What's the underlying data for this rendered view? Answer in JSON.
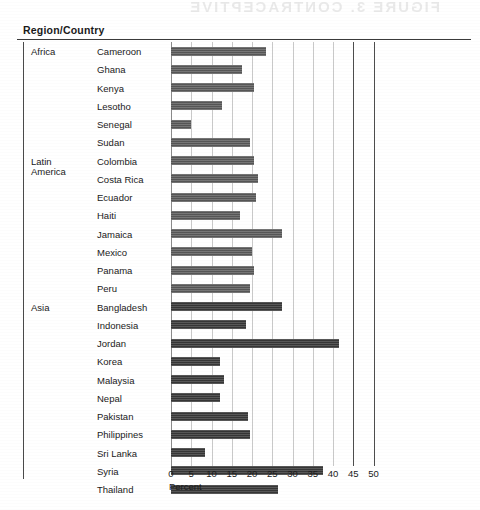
{
  "header": {
    "title": "Region/Country",
    "ghost_text": "FIGURE 3. CONTRACEPTIVE"
  },
  "axis": {
    "title": "Percent",
    "ticks": [
      {
        "value": 0,
        "label": "0"
      },
      {
        "value": 5,
        "label": "5"
      },
      {
        "value": 10,
        "label": "10"
      },
      {
        "value": 15,
        "label": "15"
      },
      {
        "value": 20,
        "label": "20"
      },
      {
        "value": 25,
        "label": "25"
      },
      {
        "value": 30,
        "label": "30"
      },
      {
        "value": 35,
        "label": "35"
      },
      {
        "value": 40,
        "label": "40"
      },
      {
        "value": 45,
        "label": "45"
      },
      {
        "value": 50,
        "label": "50"
      }
    ],
    "min": 0,
    "max": 50,
    "px_per_unit": 4.05
  },
  "regions": [
    {
      "name": "Africa",
      "lines": [
        "Africa"
      ],
      "start_index": 0
    },
    {
      "name": "Latin America",
      "lines": [
        "Latin",
        "America"
      ],
      "start_index": 6
    },
    {
      "name": "Asia",
      "lines": [
        "Asia"
      ],
      "start_index": 14
    }
  ],
  "chart_data": {
    "type": "bar",
    "orientation": "horizontal",
    "title": "",
    "xlabel": "Percent",
    "ylabel": "Region/Country",
    "xlim": [
      0,
      50
    ],
    "xticks": [
      0,
      5,
      10,
      15,
      20,
      25,
      30,
      35,
      40,
      45,
      50
    ],
    "grid": true,
    "legend": "none",
    "group_label": "Region/Country",
    "groups": [
      "Africa",
      "Latin America",
      "Asia"
    ],
    "categories": [
      "Cameroon",
      "Ghana",
      "Kenya",
      "Lesotho",
      "Senegal",
      "Sudan",
      "Colombia",
      "Costa Rica",
      "Ecuador",
      "Haiti",
      "Jamaica",
      "Mexico",
      "Panama",
      "Peru",
      "Bangladesh",
      "Indonesia",
      "Jordan",
      "Korea",
      "Malaysia",
      "Nepal",
      "Pakistan",
      "Philippines",
      "Sri Lanka",
      "Syria",
      "Thailand"
    ],
    "values": [
      23.5,
      17.5,
      20.5,
      12.5,
      5.0,
      19.5,
      20.5,
      21.5,
      21.0,
      17.0,
      27.5,
      20.0,
      20.5,
      19.5,
      27.5,
      18.5,
      41.5,
      12.0,
      13.0,
      12.0,
      19.0,
      19.5,
      8.5,
      37.5,
      26.5
    ],
    "groups_by_category": [
      "Africa",
      "Africa",
      "Africa",
      "Africa",
      "Africa",
      "Africa",
      "Latin America",
      "Latin America",
      "Latin America",
      "Latin America",
      "Latin America",
      "Latin America",
      "Latin America",
      "Latin America",
      "Asia",
      "Asia",
      "Asia",
      "Asia",
      "Asia",
      "Asia",
      "Asia",
      "Asia",
      "Asia",
      "Asia",
      "Asia"
    ]
  }
}
